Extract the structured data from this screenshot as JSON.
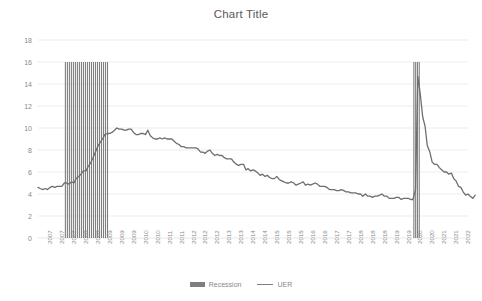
{
  "chart_data": {
    "type": "line",
    "title": "Chart Title",
    "xlabel": "",
    "ylabel": "",
    "ylim": [
      0,
      18
    ],
    "ytick_values": [
      0,
      2,
      4,
      6,
      8,
      10,
      12,
      14,
      16,
      18
    ],
    "ytick_labels": [
      "0",
      "2",
      "4",
      "6",
      "8",
      "10",
      "12",
      "14",
      "16",
      "18"
    ],
    "grid": true,
    "grid_color": "#e8e8e8",
    "legend_position": "bottom",
    "xlim": [
      2007.0,
      2022.0
    ],
    "xtick_labels": [
      "2007",
      "2007",
      "2007",
      "2008",
      "2008",
      "2009",
      "2009",
      "2009",
      "2010",
      "2010",
      "2011",
      "2011",
      "2012",
      "2012",
      "2012",
      "2013",
      "2013",
      "2014",
      "2014",
      "2015",
      "2015",
      "2015",
      "2016",
      "2016",
      "2017",
      "2017",
      "2018",
      "2018",
      "2018",
      "2019",
      "2019",
      "2020",
      "2020",
      "2021",
      "2021",
      "2022"
    ],
    "series": [
      {
        "name": "Recession",
        "type": "bar",
        "color": "#7f7f7f",
        "bar_top_value": 16,
        "bands": [
          {
            "start": 2007.92,
            "end": 2009.46
          },
          {
            "start": 2020.08,
            "end": 2020.33
          }
        ]
      },
      {
        "name": "UER",
        "type": "line",
        "color": "#6e6e6e",
        "x": [
          2007.0,
          2007.08,
          2007.17,
          2007.25,
          2007.33,
          2007.42,
          2007.5,
          2007.58,
          2007.67,
          2007.75,
          2007.83,
          2007.92,
          2008.0,
          2008.08,
          2008.17,
          2008.25,
          2008.33,
          2008.42,
          2008.5,
          2008.58,
          2008.67,
          2008.75,
          2008.83,
          2008.92,
          2009.0,
          2009.08,
          2009.17,
          2009.25,
          2009.33,
          2009.42,
          2009.5,
          2009.58,
          2009.67,
          2009.75,
          2009.83,
          2009.92,
          2010.0,
          2010.08,
          2010.17,
          2010.25,
          2010.33,
          2010.42,
          2010.5,
          2010.58,
          2010.67,
          2010.75,
          2010.83,
          2010.92,
          2011.0,
          2011.08,
          2011.17,
          2011.25,
          2011.33,
          2011.42,
          2011.5,
          2011.58,
          2011.67,
          2011.75,
          2011.83,
          2011.92,
          2012.0,
          2012.08,
          2012.17,
          2012.25,
          2012.33,
          2012.42,
          2012.5,
          2012.58,
          2012.67,
          2012.75,
          2012.83,
          2012.92,
          2013.0,
          2013.08,
          2013.17,
          2013.25,
          2013.33,
          2013.42,
          2013.5,
          2013.58,
          2013.67,
          2013.75,
          2013.83,
          2013.92,
          2014.0,
          2014.08,
          2014.17,
          2014.25,
          2014.33,
          2014.42,
          2014.5,
          2014.58,
          2014.67,
          2014.75,
          2014.83,
          2014.92,
          2015.0,
          2015.08,
          2015.17,
          2015.25,
          2015.33,
          2015.42,
          2015.5,
          2015.58,
          2015.67,
          2015.75,
          2015.83,
          2015.92,
          2016.0,
          2016.08,
          2016.17,
          2016.25,
          2016.33,
          2016.42,
          2016.5,
          2016.58,
          2016.67,
          2016.75,
          2016.83,
          2016.92,
          2017.0,
          2017.08,
          2017.17,
          2017.25,
          2017.33,
          2017.42,
          2017.5,
          2017.58,
          2017.67,
          2017.75,
          2017.83,
          2017.92,
          2018.0,
          2018.08,
          2018.17,
          2018.25,
          2018.33,
          2018.42,
          2018.5,
          2018.58,
          2018.67,
          2018.75,
          2018.83,
          2018.92,
          2019.0,
          2019.08,
          2019.17,
          2019.25,
          2019.33,
          2019.42,
          2019.5,
          2019.58,
          2019.67,
          2019.75,
          2019.83,
          2019.92,
          2020.0,
          2020.08,
          2020.17,
          2020.25,
          2020.33,
          2020.42,
          2020.5,
          2020.58,
          2020.67,
          2020.75,
          2020.83,
          2020.92,
          2021.0,
          2021.08,
          2021.17,
          2021.25,
          2021.33,
          2021.42,
          2021.5,
          2021.58,
          2021.67,
          2021.75,
          2021.83,
          2021.92,
          2022.0,
          2022.08,
          2022.17,
          2022.25
        ],
        "y": [
          4.6,
          4.5,
          4.4,
          4.5,
          4.4,
          4.6,
          4.7,
          4.6,
          4.7,
          4.7,
          4.7,
          5.0,
          5.0,
          4.9,
          5.1,
          5.0,
          5.4,
          5.6,
          5.8,
          6.1,
          6.1,
          6.5,
          6.8,
          7.3,
          7.8,
          8.3,
          8.7,
          9.0,
          9.4,
          9.5,
          9.5,
          9.6,
          9.8,
          10.0,
          9.9,
          9.9,
          9.8,
          9.8,
          9.9,
          9.9,
          9.6,
          9.4,
          9.4,
          9.5,
          9.5,
          9.4,
          9.8,
          9.3,
          9.1,
          9.0,
          9.0,
          9.1,
          9.0,
          9.1,
          9.0,
          9.0,
          9.0,
          8.8,
          8.6,
          8.5,
          8.3,
          8.3,
          8.2,
          8.2,
          8.2,
          8.2,
          8.2,
          8.1,
          7.8,
          7.8,
          7.7,
          7.9,
          8.0,
          7.7,
          7.5,
          7.6,
          7.5,
          7.5,
          7.3,
          7.2,
          7.2,
          7.2,
          6.9,
          6.7,
          6.6,
          6.7,
          6.7,
          6.2,
          6.3,
          6.1,
          6.2,
          6.1,
          5.9,
          5.7,
          5.8,
          5.6,
          5.7,
          5.5,
          5.4,
          5.4,
          5.6,
          5.3,
          5.2,
          5.1,
          5.0,
          5.0,
          5.1,
          5.0,
          4.8,
          4.9,
          5.0,
          5.1,
          4.8,
          4.9,
          4.8,
          4.9,
          5.0,
          4.9,
          4.7,
          4.7,
          4.7,
          4.6,
          4.4,
          4.4,
          4.4,
          4.3,
          4.3,
          4.4,
          4.3,
          4.2,
          4.2,
          4.1,
          4.1,
          4.1,
          4.0,
          4.0,
          3.8,
          4.0,
          3.8,
          3.8,
          3.7,
          3.8,
          3.8,
          3.9,
          4.0,
          3.8,
          3.8,
          3.6,
          3.6,
          3.6,
          3.7,
          3.7,
          3.5,
          3.6,
          3.6,
          3.6,
          3.5,
          3.5,
          4.4,
          14.7,
          13.2,
          11.0,
          10.2,
          8.4,
          7.8,
          6.9,
          6.7,
          6.7,
          6.4,
          6.2,
          6.0,
          6.0,
          5.8,
          5.9,
          5.4,
          5.2,
          4.7,
          4.6,
          4.2,
          3.9,
          4.0,
          3.8,
          3.6,
          3.9
        ]
      }
    ]
  },
  "legend": {
    "items": [
      {
        "label": "Recession",
        "marker": "box"
      },
      {
        "label": "UER",
        "marker": "line"
      }
    ]
  },
  "colors": {
    "line": "#6e6e6e",
    "recession": "#7f7f7f",
    "grid": "#e8e8e8",
    "text": "#8a8a8a",
    "title": "#595959"
  }
}
